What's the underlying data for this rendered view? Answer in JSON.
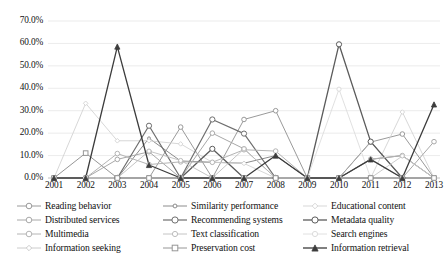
{
  "chart_data": {
    "type": "line",
    "title": "",
    "xlabel": "",
    "ylabel": "",
    "ylim": [
      0,
      70
    ],
    "ytick_labels": [
      "0.0%",
      "10.0%",
      "20.0%",
      "30.0%",
      "40.0%",
      "50.0%",
      "60.0%",
      "70.0%"
    ],
    "ytick_values": [
      0,
      10,
      20,
      30,
      40,
      50,
      60,
      70
    ],
    "grid": "horizontal",
    "legend_position": "bottom",
    "legend_columns": 3,
    "categories": [
      "2001",
      "2002",
      "2003",
      "2004",
      "2005",
      "2006",
      "2007",
      "2008",
      "2009",
      "2010",
      "2011",
      "2012",
      "2013"
    ],
    "value_suffix": "%",
    "series": [
      {
        "name": "Reading behavior",
        "marker": "circle",
        "marker_size": 4.6,
        "color": "#9a9a9a",
        "line_width": 1.0,
        "values": [
          0.0,
          0.0,
          0.0,
          0.0,
          22.7,
          0.0,
          26.1,
          30.0,
          0.0,
          0.0,
          16.0,
          19.6,
          0.0
        ]
      },
      {
        "name": "Similarity performance",
        "marker": "circle",
        "marker_size": 2.9,
        "color": "#8c8c8c",
        "line_width": 1.0,
        "values": [
          0.0,
          0.0,
          0.0,
          17.7,
          7.6,
          7.0,
          6.6,
          10.0,
          0.0,
          0.0,
          8.3,
          10.0,
          0.0
        ]
      },
      {
        "name": "Educational content",
        "marker": "diamond",
        "marker_size": 3.4,
        "color": "#d2d2d2",
        "line_width": 0.9,
        "values": [
          0.0,
          33.3,
          16.6,
          16.6,
          15.2,
          7.0,
          6.5,
          0.0,
          0.0,
          0.0,
          0.0,
          29.4,
          0.0
        ]
      },
      {
        "name": "Distributed services",
        "marker": "circle",
        "marker_size": 4.6,
        "color": "#a8a8a8",
        "line_width": 1.0,
        "values": [
          0.0,
          0.0,
          8.3,
          11.7,
          0.0,
          20.0,
          13.0,
          0.0,
          0.0,
          0.0,
          16.2,
          0.0,
          16.2
        ]
      },
      {
        "name": "Recommending systems",
        "marker": "circle",
        "marker_size": 5.2,
        "color": "#6e6e6e",
        "line_width": 1.2,
        "values": [
          0.0,
          0.0,
          0.0,
          23.3,
          0.0,
          26.1,
          19.8,
          0.0,
          0.0,
          0.0,
          0.0,
          0.0,
          0.0
        ]
      },
      {
        "name": "Metadata quality",
        "marker": "circle",
        "marker_size": 5.2,
        "color": "#5b5b5b",
        "line_width": 1.3,
        "values": [
          0.0,
          0.0,
          0.0,
          0.0,
          0.0,
          13.0,
          0.0,
          0.0,
          0.0,
          59.6,
          16.2,
          0.0,
          0.0
        ]
      },
      {
        "name": "Multimedia",
        "marker": "circle",
        "marker_size": 4.6,
        "color": "#b4b4b4",
        "line_width": 1.0,
        "values": [
          0.0,
          0.0,
          10.9,
          6.0,
          7.2,
          7.0,
          12.6,
          12.0,
          0.0,
          0.0,
          8.4,
          10.0,
          0.0
        ]
      },
      {
        "name": "Text classification",
        "marker": "circle",
        "marker_size": 4.2,
        "color": "#bdbdbd",
        "line_width": 0.9,
        "values": [
          0.0,
          0.0,
          0.0,
          12.0,
          7.8,
          0.0,
          13.0,
          0.0,
          0.0,
          0.0,
          8.2,
          0.0,
          0.0
        ]
      },
      {
        "name": "Search engines",
        "marker": "circle",
        "marker_size": 4.2,
        "color": "#dcdcdc",
        "line_width": 0.9,
        "values": [
          0.0,
          0.0,
          0.0,
          0.0,
          0.0,
          0.0,
          0.0,
          0.0,
          0.0,
          39.6,
          0.0,
          0.0,
          0.0
        ]
      },
      {
        "name": "Information seeking",
        "marker": "diamond",
        "marker_size": 3.2,
        "color": "#c6c6c6",
        "line_width": 0.9,
        "values": [
          0.0,
          0.0,
          0.0,
          0.0,
          0.0,
          0.0,
          0.0,
          0.0,
          0.0,
          0.0,
          0.0,
          9.8,
          0.0
        ]
      },
      {
        "name": "Preservation cost",
        "marker": "square",
        "marker_size": 4.6,
        "color": "#969696",
        "line_width": 1.0,
        "values": [
          0.0,
          11.1,
          0.0,
          0.0,
          0.0,
          0.0,
          0.0,
          0.0,
          0.0,
          0.0,
          0.0,
          0.0,
          0.0
        ]
      },
      {
        "name": "Information retrieval",
        "marker": "triangle",
        "marker_size": 4.4,
        "color": "#3c3c3c",
        "line_width": 1.3,
        "values": [
          0.0,
          0.0,
          58.6,
          5.8,
          0.0,
          0.0,
          0.0,
          10.0,
          0.0,
          0.0,
          8.3,
          0.0,
          32.8
        ]
      }
    ]
  },
  "legend": {
    "items": [
      {
        "label": "Reading behavior"
      },
      {
        "label": "Similarity performance"
      },
      {
        "label": "Educational content"
      },
      {
        "label": "Distributed services"
      },
      {
        "label": "Recommending systems"
      },
      {
        "label": "Metadata quality"
      },
      {
        "label": "Multimedia"
      },
      {
        "label": "Text classification"
      },
      {
        "label": "Search engines"
      },
      {
        "label": "Information seeking"
      },
      {
        "label": "Preservation cost"
      },
      {
        "label": "Information retrieval"
      }
    ]
  }
}
